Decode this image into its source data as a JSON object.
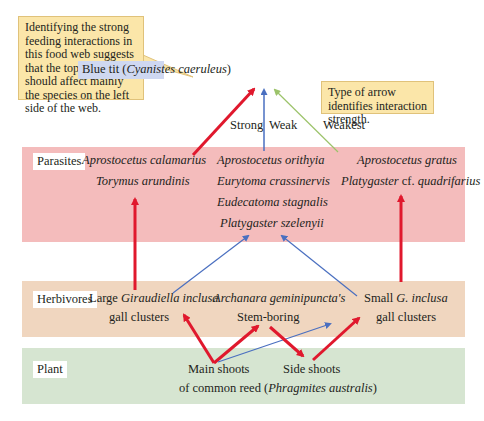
{
  "callouts": {
    "left": "Identifying the strong feeding interactions in this food web suggests that the top predator should affect mainly the species on the left side of the web.",
    "right": "Type of arrow identifies interaction strength."
  },
  "top_predator": {
    "common": "Blue tit (",
    "latin": "Cyanistes caeruleus",
    "close": ")"
  },
  "legend": {
    "strong": "Strong",
    "weak": "Weak",
    "weakest": "Weakest"
  },
  "levels": {
    "parasites": "Parasites",
    "herbivores": "Herbivores",
    "plant": "Plant"
  },
  "parasites": {
    "left": [
      "Aprostocetus calamarius",
      "Torymus arundinis"
    ],
    "middle": [
      "Aprostocetus orithyia",
      "Eurytoma crassinervis",
      "Eudecatoma stagnalis",
      "Platygaster szelenyii"
    ],
    "right": [
      "Aprostocetus gratus",
      "Platygaster cf. quadrifarius"
    ]
  },
  "herbivores": {
    "left": {
      "pre": "Large ",
      "latin": "Giraudiella inclusa",
      "line2": "gall clusters"
    },
    "middle": {
      "latin": "Archanara geminipuncta's",
      "line2": "Stem-boring"
    },
    "right": {
      "pre": "Small ",
      "latin": "G. inclusa",
      "line2": "gall clusters"
    }
  },
  "plant": {
    "main": "Main shoots",
    "side": "Side shoots",
    "line2_pre": "of common reed (",
    "line2_latin": "Phragmites australis",
    "line2_post": ")"
  },
  "colors": {
    "strong": "#e0182d",
    "weak": "#4a6fc0",
    "weakest": "#9cc36a"
  }
}
